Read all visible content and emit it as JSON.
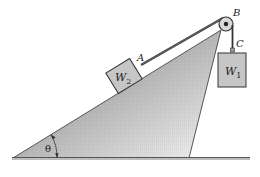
{
  "diagram": {
    "title": "",
    "labels": {
      "point_a": "A",
      "point_b": "B",
      "point_c": "C",
      "block_on_incline": {
        "base": "W",
        "subscript": "2"
      },
      "hanging_block": {
        "base": "W",
        "subscript": "1"
      },
      "angle": "θ"
    },
    "colors": {
      "incline_dark": "#8a8a8a",
      "incline_light": "#f2f2f2",
      "block_fill": "#c4c4c4",
      "stroke": "#333333",
      "ground": "#666666"
    },
    "elements": [
      "inclined-plane",
      "block-w2-on-incline",
      "rope-a-to-b",
      "pulley-b",
      "rope-b-to-c",
      "block-w1-hanging",
      "support-strut",
      "ground-line",
      "angle-arc-theta"
    ]
  }
}
